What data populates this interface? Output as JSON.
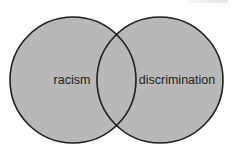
{
  "diagram": {
    "type": "venn",
    "background": "#ffffff",
    "fill_color": "#b8b8b8",
    "stroke_color": "#1e1e1e",
    "sets": [
      {
        "id": "left",
        "label": "racism",
        "cx": 73,
        "cy": 80,
        "r": 63
      },
      {
        "id": "right",
        "label": "discrimination",
        "cx": 160,
        "cy": 80,
        "r": 63
      }
    ]
  }
}
